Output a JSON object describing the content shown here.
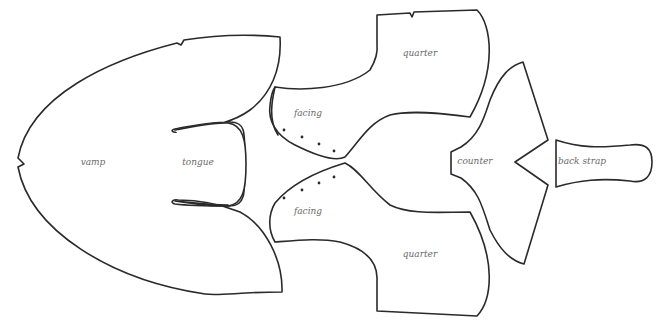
{
  "colors": {
    "outline": "#2a2a2a",
    "label": "#6a6a6a",
    "background": "#ffffff"
  },
  "pieces": {
    "vamp": {
      "label": "vamp"
    },
    "tongue": {
      "label": "tongue"
    },
    "facing_upper": {
      "label": "facing",
      "punch_holes": 4
    },
    "facing_lower": {
      "label": "facing",
      "punch_holes": 4
    },
    "quarter_upper": {
      "label": "quarter"
    },
    "quarter_lower": {
      "label": "quarter"
    },
    "counter": {
      "label": "counter"
    },
    "back_strap": {
      "label": "back strap"
    }
  }
}
